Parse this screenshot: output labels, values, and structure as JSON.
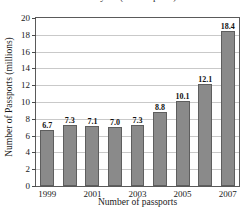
{
  "chart_data": {
    "type": "bar",
    "title": "Fiscal year (from reports)",
    "xlabel": "Number of passports",
    "ylabel": "Number of Passports (millions)",
    "categories": [
      "1999",
      "2000",
      "2001",
      "2002",
      "2003",
      "2004",
      "2005",
      "2006",
      "2007"
    ],
    "values": [
      6.7,
      7.3,
      7.1,
      7.0,
      7.3,
      8.8,
      10.1,
      12.1,
      18.4
    ],
    "value_labels": [
      "6.7",
      "7.3",
      "7.1",
      "7.0",
      "7.3",
      "8.8",
      "10.1",
      "12.1",
      "18.4"
    ],
    "visible_tick_labels": [
      "1999",
      "",
      "2001",
      "",
      "2003",
      "",
      "2005",
      "",
      "2007"
    ],
    "ylim": [
      0,
      20
    ],
    "ytick_step": 2,
    "ytick_labels": [
      "20",
      "18",
      "16",
      "14",
      "12",
      "10",
      "8",
      "6",
      "4",
      "2",
      "0"
    ],
    "grid": true,
    "legend": false,
    "bar_color": "#8a8a8a",
    "bar_border_color": "#5e5e5e",
    "grid_color": "#c9c9c9",
    "axis_color": "#5a5a5a"
  }
}
